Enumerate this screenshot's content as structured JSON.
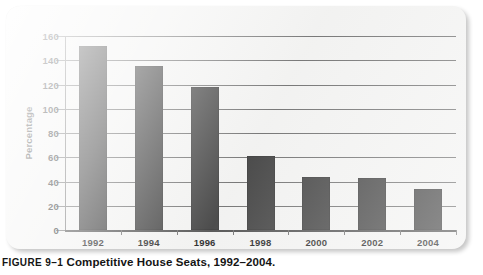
{
  "figure": {
    "number_label": "FIGURE 9–1",
    "caption": "Competitive House Seats, 1992–2004."
  },
  "colors": {
    "bar": "#3a3a3a",
    "panel": "#f2f2f1",
    "gridline": "#6b6b6b",
    "text": "#1a1a1a"
  },
  "chart_data": {
    "type": "bar",
    "title": "Competitive House Seats, 1992–2004.",
    "xlabel": "",
    "ylabel": "Percentage",
    "categories": [
      "1992",
      "1994",
      "1996",
      "1998",
      "2000",
      "2002",
      "2004"
    ],
    "values": [
      152,
      135,
      118,
      61,
      44,
      43,
      34
    ],
    "ylim": [
      0,
      160
    ],
    "ytick_labels": [
      "160",
      "140",
      "120",
      "100",
      "80",
      "60",
      "40",
      "20",
      "0"
    ],
    "ytick_values": [
      160,
      140,
      120,
      100,
      80,
      60,
      40,
      20,
      0
    ],
    "grid": true,
    "legend": "none"
  }
}
